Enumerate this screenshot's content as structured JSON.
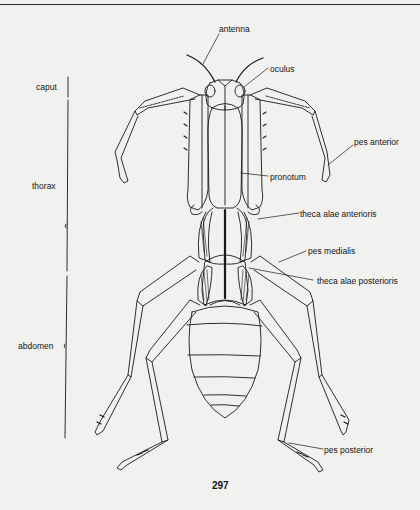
{
  "figure": {
    "regions": [
      {
        "id": "caput",
        "label": "caput"
      },
      {
        "id": "thorax",
        "label": "thorax"
      },
      {
        "id": "abdomen",
        "label": "abdomen"
      }
    ],
    "labels": {
      "antenna": "antenna",
      "oculus": "oculus",
      "pes_anterior": "pes anterior",
      "pronotum": "pronotum",
      "theca_alae_anterioris": "theca alae anterioris",
      "pes_medialis": "pes medialis",
      "theca_alae_posterioris": "theca alae posterioris",
      "pes_posterior": "pes posterior"
    },
    "colors": {
      "ink": "#1a1a1a",
      "paper": "#f1f1ef"
    }
  },
  "page": {
    "number": "297"
  }
}
